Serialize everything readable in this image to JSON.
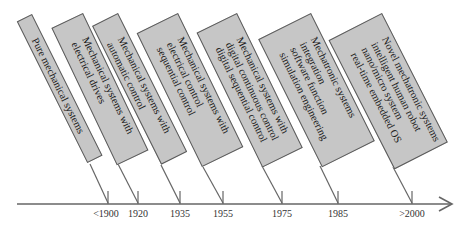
{
  "colors": {
    "box_fill": "#c6c6c6",
    "box_border": "#5a5a5a",
    "line": "#666666",
    "text": "#1a1a1a"
  },
  "timeline": {
    "axis_arrow": "right",
    "events": [
      {
        "year": "<1900",
        "lines": [
          "Pure mechanical systems"
        ]
      },
      {
        "year": "1920",
        "lines": [
          "Mechanical systems with",
          "electrical drives"
        ]
      },
      {
        "year": "1935",
        "lines": [
          "Mechanical systems with",
          "automatic control"
        ]
      },
      {
        "year": "1955",
        "lines": [
          "Mechanical systems with",
          "electrical control",
          "sequential control"
        ]
      },
      {
        "year": "1975",
        "lines": [
          "Mechanical systems with",
          "digital continuous control",
          "digital sequential control"
        ]
      },
      {
        "year": "1985",
        "lines": [
          "Mechatronic systems",
          "integration",
          "software function",
          "simulation engineering"
        ]
      },
      {
        "year": ">2000",
        "lines": [
          "Novel mechatronic systems",
          "intelligent human robot",
          "nano/micro system",
          "real-time embedded OS"
        ]
      }
    ]
  }
}
